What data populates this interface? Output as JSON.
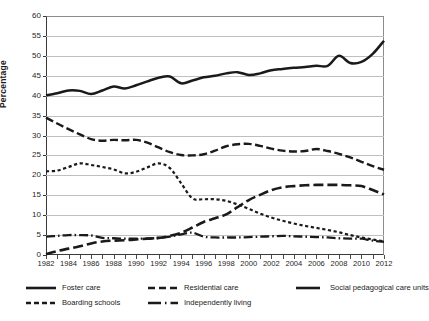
{
  "chart_data": {
    "type": "line",
    "title": "",
    "xlabel": "",
    "ylabel": "Percentage",
    "xlim": [
      1982,
      2012
    ],
    "ylim": [
      0,
      60
    ],
    "ytick_step": 5,
    "xtick_step": 2,
    "grid": true,
    "legend_position": "bottom",
    "yticks": [
      "0",
      "5",
      "10",
      "15",
      "20",
      "25",
      "30",
      "35",
      "40",
      "45",
      "50",
      "55",
      "60"
    ],
    "xticks": [
      "1982",
      "1984",
      "1986",
      "1988",
      "1990",
      "1992",
      "1994",
      "1996",
      "1998",
      "2000",
      "2002",
      "2004",
      "2006",
      "2008",
      "2010",
      "2012"
    ],
    "x": [
      1982,
      1983,
      1984,
      1985,
      1986,
      1987,
      1988,
      1989,
      1990,
      1991,
      1992,
      1993,
      1994,
      1995,
      1996,
      1997,
      1998,
      1999,
      2000,
      2001,
      2002,
      2003,
      2004,
      2005,
      2006,
      2007,
      2008,
      2009,
      2010,
      2011,
      2012
    ],
    "series": [
      {
        "name": "Foster care",
        "style": "solid",
        "color": "#1a1a1a",
        "values": [
          40.1,
          40.6,
          41.3,
          41.2,
          40.4,
          41.3,
          42.3,
          41.8,
          42.6,
          43.6,
          44.5,
          44.8,
          43.1,
          43.8,
          44.6,
          45.0,
          45.6,
          45.9,
          45.2,
          45.6,
          46.4,
          46.7,
          47.0,
          47.2,
          47.5,
          47.5,
          50.0,
          48.2,
          48.5,
          50.5,
          53.8
        ]
      },
      {
        "name": "Boarding schools",
        "style": "dashed",
        "color": "#1a1a1a",
        "values": [
          34.5,
          33.0,
          31.6,
          30.3,
          29.1,
          28.7,
          28.9,
          28.8,
          28.9,
          28.2,
          27.0,
          25.8,
          25.1,
          25.0,
          25.3,
          26.2,
          27.3,
          27.8,
          27.9,
          27.4,
          26.7,
          26.2,
          26.0,
          26.1,
          26.6,
          26.1,
          25.4,
          24.5,
          23.4,
          22.3,
          21.4
        ]
      },
      {
        "name": "Residential care",
        "style": "dotted",
        "color": "#1a1a1a",
        "values": [
          21.0,
          21.2,
          22.1,
          23.0,
          22.6,
          22.1,
          21.5,
          20.5,
          20.9,
          22.0,
          23.0,
          21.8,
          18.0,
          14.2,
          14.0,
          14.0,
          13.6,
          12.7,
          11.6,
          10.4,
          9.4,
          8.6,
          7.9,
          7.3,
          6.8,
          6.3,
          5.7,
          5.0,
          4.4,
          3.9,
          3.4
        ]
      },
      {
        "name": "Social pedagogical care units",
        "style": "longdash",
        "color": "#1a1a1a",
        "values": [
          0.2,
          1.0,
          1.6,
          2.2,
          2.9,
          3.4,
          3.6,
          3.7,
          3.9,
          4.1,
          4.3,
          4.8,
          5.6,
          6.9,
          8.3,
          9.2,
          10.2,
          12.0,
          13.8,
          15.1,
          16.3,
          17.0,
          17.3,
          17.5,
          17.6,
          17.6,
          17.6,
          17.5,
          17.3,
          16.3,
          15.2
        ]
      },
      {
        "name": "Independently living",
        "style": "dashdot",
        "color": "#1a1a1a",
        "values": [
          4.6,
          4.8,
          5.0,
          5.0,
          4.9,
          4.3,
          4.2,
          4.1,
          4.1,
          4.1,
          4.3,
          4.6,
          5.2,
          5.6,
          4.6,
          4.4,
          4.4,
          4.4,
          4.5,
          4.6,
          4.7,
          4.8,
          4.7,
          4.6,
          4.5,
          4.4,
          4.2,
          4.1,
          4.1,
          3.6,
          3.3
        ]
      }
    ]
  },
  "legend": {
    "items": [
      {
        "label": "Foster care",
        "style": "solid"
      },
      {
        "label": "Residential care",
        "style": "dashed"
      },
      {
        "label": "Social pedagogical care units",
        "style": "solid"
      },
      {
        "label": "Boarding schools",
        "style": "dashed-short"
      },
      {
        "label": "Independently living",
        "style": "dashdot"
      }
    ]
  }
}
